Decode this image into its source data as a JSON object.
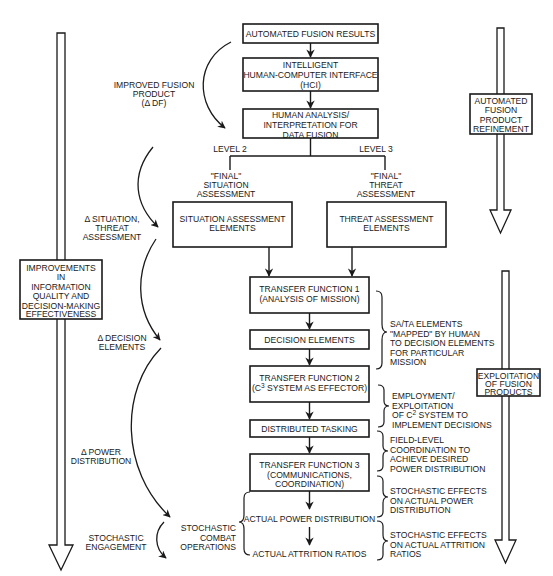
{
  "diagram": {
    "flow_boxes": {
      "automated_fusion_results": "AUTOMATED FUSION RESULTS",
      "hci": [
        "INTELLIGENT",
        "HUMAN-COMPUTER INTERFACE",
        "(HCI)"
      ],
      "human_analysis": [
        "HUMAN ANALYSIS/",
        "INTERPRETATION FOR",
        "DATA FUSION"
      ],
      "situation_assessment_elements": [
        "SITUATION ASSESSMENT",
        "ELEMENTS"
      ],
      "threat_assessment_elements": [
        "THREAT ASSESSMENT",
        "ELEMENTS"
      ],
      "transfer_function_1": [
        "TRANSFER FUNCTION 1",
        "(ANALYSIS OF MISSION)"
      ],
      "decision_elements": "DECISION ELEMENTS",
      "transfer_function_2": [
        "TRANSFER FUNCTION 2",
        "(C",
        "3",
        " SYSTEM AS EFFECTOR)"
      ],
      "distributed_tasking": "DISTRIBUTED TASKING",
      "transfer_function_3": [
        "TRANSFER FUNCTION 3",
        "(COMMUNICATIONS,",
        "COORDINATION)"
      ]
    },
    "branch_labels": {
      "level_2": "LEVEL 2",
      "level_3": "LEVEL 3",
      "final_situation": [
        "\"FINAL\"",
        "SITUATION",
        "ASSESSMENT"
      ],
      "final_threat": [
        "\"FINAL\"",
        "THREAT",
        "ASSESSMENT"
      ]
    },
    "outcomes": {
      "actual_power_distribution": "ACTUAL POWER DISTRIBUTION",
      "actual_attrition_ratios": "ACTUAL ATTRITION RATIOS"
    },
    "left_labels": {
      "improved_fusion_product": [
        "IMPROVED FUSION",
        "PRODUCT",
        "(Δ DF)"
      ],
      "delta_situation_threat": [
        "Δ SITUATION,",
        "THREAT",
        "ASSESSMENT"
      ],
      "delta_decision_elements": [
        "Δ DECISION",
        "ELEMENTS"
      ],
      "delta_power_distribution": [
        "Δ POWER",
        "DISTRIBUTION"
      ],
      "stochastic_engagement": [
        "STOCHASTIC",
        "ENGAGEMENT"
      ],
      "stochastic_combat_operations": [
        "STOCHASTIC",
        "COMBAT",
        "OPERATIONS"
      ]
    },
    "right_annotations": {
      "sa_ta_mapping": [
        "SA/TA ELEMENTS",
        "\"MAPPED\" BY HUMAN",
        "TO DECISION ELEMENTS",
        "FOR PARTICULAR",
        "MISSION"
      ],
      "employment": [
        "EMPLOYMENT/",
        "EXPLOITATION",
        "OF C",
        "2",
        " SYSTEM TO",
        "IMPLEMENT DECISIONS"
      ],
      "field_level": [
        "FIELD-LEVEL",
        "COORDINATION TO",
        "ACHIEVE DESIRED",
        "POWER DISTRIBUTION"
      ],
      "stochastic_power": [
        "STOCHASTIC EFFECTS",
        "ON ACTUAL POWER",
        "DISTRIBUTION"
      ],
      "stochastic_attrition": [
        "STOCHASTIC EFFECTS",
        "ON ACTUAL ATTRITION",
        "RATIOS"
      ]
    },
    "side_arrows": {
      "left_improvements": [
        "IMPROVEMENTS",
        "IN",
        "INFORMATION",
        "QUALITY AND",
        "DECISION-MAKING",
        "EFFECTIVENESS"
      ],
      "right_refinement": [
        "AUTOMATED",
        "FUSION",
        "PRODUCT",
        "REFINEMENT"
      ],
      "right_exploitation": [
        "EXPLOITATION",
        "OF FUSION",
        "PRODUCTS"
      ]
    }
  }
}
